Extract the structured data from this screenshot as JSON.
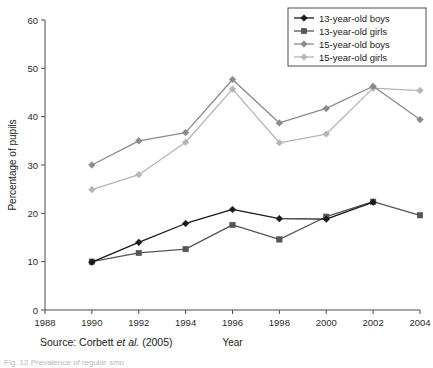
{
  "chart_data": {
    "type": "line",
    "title": "",
    "xlabel": "Year",
    "ylabel": "Percentage of pupils",
    "xlim": [
      1988,
      2004
    ],
    "ylim": [
      0,
      60
    ],
    "xticks": [
      1988,
      1990,
      1992,
      1994,
      1996,
      1998,
      2000,
      2002,
      2004
    ],
    "yticks": [
      0,
      10,
      20,
      30,
      40,
      50,
      60
    ],
    "grid": false,
    "legend_position": "top-right",
    "x": [
      1990,
      1992,
      1994,
      1996,
      1998,
      2000,
      2002,
      2004
    ],
    "series": [
      {
        "name": "13-year-old boys",
        "color": "#1a1a1a",
        "marker": "diamond",
        "x": [
          1990,
          1992,
          1994,
          1996,
          1998,
          2000,
          2002
        ],
        "values": [
          9.9,
          14.0,
          17.9,
          20.8,
          18.9,
          18.8,
          22.3
        ]
      },
      {
        "name": "13-year-old girls",
        "color": "#555555",
        "marker": "square",
        "x": [
          1990,
          1992,
          1994,
          1996,
          1998,
          2000,
          2002,
          2004
        ],
        "values": [
          10.0,
          11.8,
          12.6,
          17.6,
          14.6,
          19.3,
          22.4,
          19.6
        ]
      },
      {
        "name": "15-year-old boys",
        "color": "#8a8a8a",
        "marker": "diamond",
        "x": [
          1990,
          1992,
          1994,
          1996,
          1998,
          2000,
          2002,
          2004
        ],
        "values": [
          30.0,
          35.0,
          36.7,
          47.7,
          38.7,
          41.7,
          46.3,
          39.4
        ]
      },
      {
        "name": "15-year-old girls",
        "color": "#b5b5b5",
        "marker": "diamond",
        "x": [
          1990,
          1992,
          1994,
          1996,
          1998,
          2000,
          2002,
          2004
        ],
        "values": [
          24.9,
          28.0,
          34.7,
          45.7,
          34.6,
          36.4,
          45.9,
          45.4
        ]
      }
    ]
  },
  "legend": {
    "entries": [
      {
        "label": "13-year-old boys"
      },
      {
        "label": "13-year-old girls"
      },
      {
        "label": "15-year-old boys"
      },
      {
        "label": "15-year-old girls"
      }
    ]
  },
  "axes": {
    "x_title": "Year",
    "y_title": "Percentage of pupils",
    "x_tick_labels": [
      "1988",
      "1990",
      "1992",
      "1994",
      "1996",
      "1998",
      "2000",
      "2002",
      "2004"
    ],
    "y_tick_labels": [
      "0",
      "10",
      "20",
      "30",
      "40",
      "50",
      "60"
    ]
  },
  "source": {
    "prefix": "Source: Corbett ",
    "italic": "et al.",
    "suffix": " (2005)"
  },
  "caption": {
    "text": "Fig. 12 Prevalence of regular smoking"
  }
}
